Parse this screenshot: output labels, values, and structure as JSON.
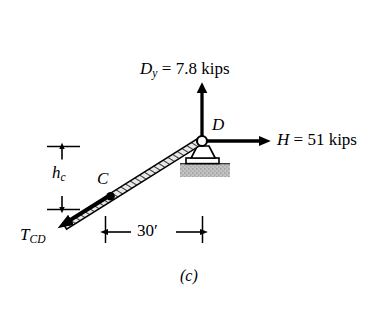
{
  "figure": {
    "caption": "(c)",
    "title_note": "free-body diagram of pin support D with cable CD",
    "background_color": "#ffffff",
    "ink_color": "#000000",
    "ground_color": "#c8c8c8"
  },
  "labels": {
    "reaction_vertical": {
      "symbol": "D",
      "subscript": "y",
      "equals": " = ",
      "value": "7.8",
      "unit": "kips",
      "full_text": "Dy = 7.8 kips"
    },
    "reaction_horizontal": {
      "symbol": "H",
      "equals": " = ",
      "value": "51",
      "unit": "kips",
      "full_text": "H = 51 kips"
    },
    "point_d": "D",
    "point_c": "C",
    "cable_tension": {
      "symbol": "T",
      "subscript": "CD",
      "full_text": "TCD"
    },
    "height_dim": {
      "symbol": "h",
      "subscript": "c",
      "full_text": "hc"
    },
    "span_dim": "30′"
  },
  "geometry": {
    "pin_d": {
      "x": 202,
      "y": 141
    },
    "point_c": {
      "x": 110,
      "y": 196
    },
    "cable_far_end": {
      "x": 58,
      "y": 228
    },
    "dy_arrow_tip": {
      "x": 202,
      "y": 90
    },
    "h_arrow_tip": {
      "x": 263,
      "y": 141
    },
    "span_dim_y": 232,
    "span_dim_x_left": 105,
    "span_dim_x_right": 203,
    "hc_dim_x": 62,
    "hc_dim_y_top": 147,
    "hc_dim_y_bottom": 209
  }
}
